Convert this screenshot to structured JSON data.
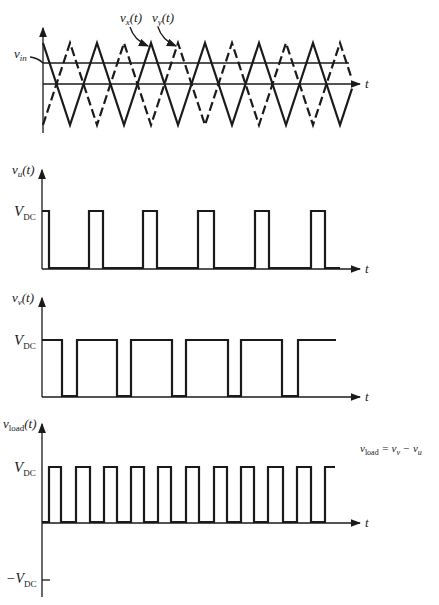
{
  "panels": {
    "carrier": {
      "labels": {
        "vin": "v",
        "vin_sub": "in",
        "vx": "v",
        "vx_sub": "x",
        "vx_arg": "(t)",
        "vy": "v",
        "vy_sub": "y",
        "vy_arg": "(t)",
        "t": "t"
      },
      "geometry": {
        "axis_x": 43,
        "zero_y": 84,
        "top_y": 43,
        "bottom_y": 125,
        "vin_y": 63,
        "period": 54,
        "x_end": 352,
        "axis_end": 362,
        "vin_line_end": 349
      }
    },
    "vu": {
      "labels": {
        "ylabel": "v",
        "ylabel_sub": "u",
        "ylabel_arg": "(t)",
        "vdc": "V",
        "vdc_sub": "DC",
        "t": "t"
      },
      "geometry": {
        "axis_x": 42,
        "high_y": 211,
        "low_y": 268,
        "axis_top": 170,
        "axis_end": 362
      },
      "high_intervals": [
        [
          42,
          49
        ],
        [
          89,
          103
        ],
        [
          143,
          157
        ],
        [
          198,
          214
        ],
        [
          255,
          269
        ],
        [
          311,
          325
        ]
      ],
      "end_x": 340
    },
    "vv": {
      "labels": {
        "ylabel": "v",
        "ylabel_sub": "v",
        "ylabel_arg": "(t)",
        "vdc": "V",
        "vdc_sub": "DC",
        "t": "t"
      },
      "geometry": {
        "axis_x": 42,
        "high_y": 340,
        "low_y": 396,
        "axis_top": 298,
        "axis_end": 362
      },
      "low_intervals": [
        [
          62,
          77
        ],
        [
          117,
          131
        ],
        [
          172,
          186
        ],
        [
          228,
          241
        ],
        [
          282,
          298
        ]
      ],
      "end_x": 336
    },
    "vload": {
      "labels": {
        "ylabel": "v",
        "ylabel_sub": "load",
        "ylabel_arg": "(t)",
        "vdc": "V",
        "vdc_sub": "DC",
        "neg_vdc": "−V",
        "neg_vdc_sub": "DC",
        "t": "t",
        "equation": {
          "lhs": "v",
          "lhs_sub": "load",
          "eq": " = v",
          "v_sub": "v",
          "minus": " − v",
          "u_sub": "u"
        }
      },
      "geometry": {
        "axis_x": 42,
        "high_y": 467,
        "zero_y": 522,
        "neg_y": 580,
        "axis_top": 424,
        "axis_bottom": 597,
        "axis_end": 362
      },
      "high_intervals": [
        [
          49,
          61
        ],
        [
          76,
          90
        ],
        [
          104,
          117
        ],
        [
          131,
          144
        ],
        [
          158,
          171
        ],
        [
          186,
          199
        ],
        [
          214,
          227
        ],
        [
          241,
          254
        ],
        [
          268,
          283
        ],
        [
          297,
          311
        ]
      ],
      "end_high_start": 325,
      "end_x": 335
    }
  },
  "colors": {
    "ink": "#1a1a1a",
    "background": "#ffffff"
  }
}
